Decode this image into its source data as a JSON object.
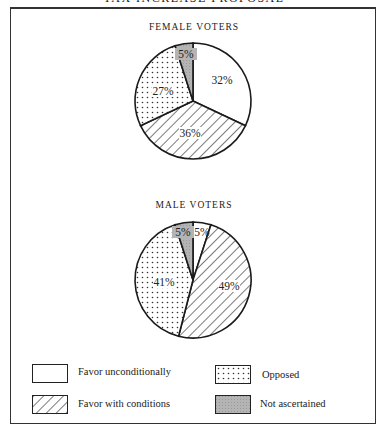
{
  "chart_data": [
    {
      "type": "pie",
      "title": "TAX INCREASE PROPOSAL",
      "subtitle": "FEMALE VOTERS",
      "categories": [
        "Favor unconditionally",
        "Favor with conditions",
        "Opposed",
        "Not ascertained"
      ],
      "values": [
        32,
        36,
        27,
        5
      ],
      "labels": [
        "32%",
        "36%",
        "27%",
        "5%"
      ]
    },
    {
      "type": "pie",
      "title": "TAX INCREASE PROPOSAL",
      "subtitle": "MALE VOTERS",
      "categories": [
        "Favor unconditionally",
        "Favor with conditions",
        "Opposed",
        "Not ascertained"
      ],
      "values": [
        5,
        49,
        41,
        5
      ],
      "labels": [
        "5%",
        "49%",
        "41%",
        "5%"
      ]
    }
  ],
  "page": {
    "title": "TAX INCREASE PROPOSAL",
    "female_title": "FEMALE VOTERS",
    "male_title": "MALE VOTERS"
  },
  "legend": {
    "position": "bottom",
    "items": [
      {
        "label": "Favor unconditionally",
        "pattern": "blank"
      },
      {
        "label": "Favor with conditions",
        "pattern": "diagonal-hatch"
      },
      {
        "label": "Opposed",
        "pattern": "dots"
      },
      {
        "label": "Not ascertained",
        "pattern": "gray"
      }
    ]
  },
  "colors": {
    "gray_fill": "#b4b4b4",
    "line": "#1a1a1a",
    "background": "#ffffff"
  }
}
